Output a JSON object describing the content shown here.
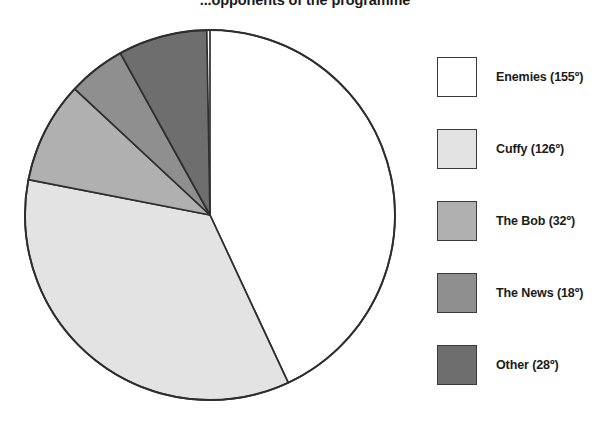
{
  "chart_data": {
    "type": "pie",
    "title": "...opponents of the programme",
    "units": "degrees",
    "total_degrees": 359,
    "start_angle_deg": 0,
    "direction": "clockwise",
    "grid": false,
    "xlabel": "",
    "ylabel": "",
    "legend_position": "right",
    "categories": [
      "Enemies",
      "Cuffy",
      "The Bob",
      "The News",
      "Other"
    ],
    "values": [
      155,
      126,
      32,
      18,
      28
    ],
    "labels": [
      "Enemies (155º)",
      "Cuffy (126º)",
      "The Bob (32º)",
      "The News (18º)",
      "Other (28º)"
    ],
    "colors": [
      "#ffffff",
      "#e3e3e3",
      "#b0b0b0",
      "#8f8f8f",
      "#6e6e6e"
    ],
    "outline_color": "#2e2e2e",
    "slices": [
      {
        "name": "Enemies",
        "value": 155,
        "label": "Enemies (155º)",
        "color": "#ffffff",
        "start_deg": 0,
        "end_deg": 155
      },
      {
        "name": "Cuffy",
        "value": 126,
        "label": "Cuffy (126º)",
        "color": "#e3e3e3",
        "start_deg": 155,
        "end_deg": 281
      },
      {
        "name": "The Bob",
        "value": 32,
        "label": "The Bob (32º)",
        "color": "#b0b0b0",
        "start_deg": 281,
        "end_deg": 313
      },
      {
        "name": "The News",
        "value": 18,
        "label": "The News (18º)",
        "color": "#8f8f8f",
        "start_deg": 313,
        "end_deg": 331
      },
      {
        "name": "Other",
        "value": 28,
        "label": "Other (28º)",
        "color": "#6e6e6e",
        "start_deg": 331,
        "end_deg": 359
      }
    ]
  },
  "legend": {
    "items": [
      {
        "label": "Enemies (155º)",
        "color": "#ffffff"
      },
      {
        "label": "Cuffy (126º)",
        "color": "#e3e3e3"
      },
      {
        "label": "The Bob (32º)",
        "color": "#b0b0b0"
      },
      {
        "label": "The News (18º)",
        "color": "#8f8f8f"
      },
      {
        "label": "Other (28º)",
        "color": "#6e6e6e"
      }
    ]
  }
}
